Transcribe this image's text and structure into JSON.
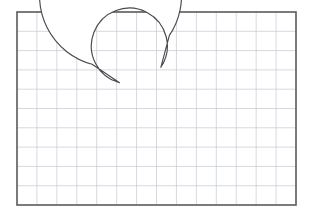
{
  "canvas": {
    "width": 313,
    "height": 220,
    "background_color": "#ffffff",
    "title": "Grid with C-shaped annulus figure"
  },
  "frame": {
    "name": "plot-border",
    "x": 17,
    "y": 12,
    "width": 279,
    "height": 193,
    "stroke_color": "#5a5a5e",
    "stroke_width": 1.6,
    "fill": "none"
  },
  "grid": {
    "name": "graph-paper-grid",
    "columns": 14,
    "rows": 10,
    "line_color": "#c2c8d4",
    "line_width": 0.7,
    "cell_width": 19.93,
    "cell_height": 19.3,
    "visible": true
  },
  "shape": {
    "name": "c-shape-annulus",
    "type": "thick-arc",
    "fill_color": "#ffffff",
    "stroke_color": "#4a4a4e",
    "stroke_width": 1.15,
    "center_x": 151,
    "center_y": 104,
    "outer_radius": 71,
    "inner_radius": 38,
    "start_angle_deg": -75,
    "end_angle_deg": 214,
    "sweep_deg": 289,
    "terminal_top": "vertical-flat-cut",
    "terminal_right": "horizontal-flat-cut",
    "path": "M 169.38 35.45 L 169.38 72.23 A 38 38 0 1 0 188.02 136.25 L 220.42 136.25 A 71 71 0 1 1 169.38 35.45 Z"
  },
  "labels": {
    "figure_caption": "",
    "axis_x": "",
    "axis_y": ""
  }
}
